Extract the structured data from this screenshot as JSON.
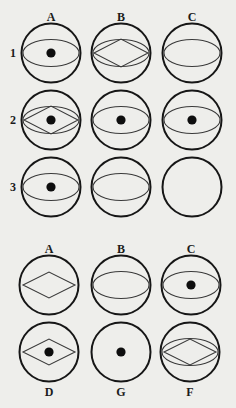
{
  "colors": {
    "background": "#eeeeeb",
    "outer_circle": "#161616",
    "inner_lines": "#3a3a3a",
    "dot": "#0e0e0e"
  },
  "puzzle": {
    "title": "Matrix puzzle",
    "column_labels": [
      {
        "text": "A",
        "x": 51,
        "y": 21
      },
      {
        "text": "B",
        "x": 121,
        "y": 21
      },
      {
        "text": "C",
        "x": 192,
        "y": 21
      }
    ],
    "row_labels": [
      {
        "text": "1",
        "x": 13,
        "y": 57
      },
      {
        "text": "2",
        "x": 13,
        "y": 124
      },
      {
        "text": "3",
        "x": 13,
        "y": 191
      }
    ],
    "cells": [
      {
        "id": "1A",
        "cx": 51,
        "cy": 53,
        "ellipse": true,
        "diamond": false,
        "dot": true
      },
      {
        "id": "1B",
        "cx": 121,
        "cy": 53,
        "ellipse": true,
        "diamond": true,
        "dot": false
      },
      {
        "id": "1C",
        "cx": 192,
        "cy": 53,
        "ellipse": true,
        "diamond": false,
        "dot": false
      },
      {
        "id": "2A",
        "cx": 51,
        "cy": 120,
        "ellipse": true,
        "diamond": true,
        "dot": true
      },
      {
        "id": "2B",
        "cx": 121,
        "cy": 120,
        "ellipse": true,
        "diamond": false,
        "dot": true
      },
      {
        "id": "2C",
        "cx": 192,
        "cy": 120,
        "ellipse": true,
        "diamond": false,
        "dot": true
      },
      {
        "id": "3A",
        "cx": 51,
        "cy": 187,
        "ellipse": true,
        "diamond": false,
        "dot": true
      },
      {
        "id": "3B",
        "cx": 121,
        "cy": 187,
        "ellipse": true,
        "diamond": false,
        "dot": false
      },
      {
        "id": "3C",
        "cx": 192,
        "cy": 187,
        "ellipse": false,
        "diamond": false,
        "dot": false,
        "missing": true
      }
    ]
  },
  "answers": {
    "options": [
      {
        "label": "A",
        "label_x": 49,
        "label_y": 253,
        "cx": 49,
        "cy": 285,
        "ellipse": false,
        "diamond": true,
        "dot": false
      },
      {
        "label": "B",
        "label_x": 121,
        "label_y": 253,
        "cx": 121,
        "cy": 285,
        "ellipse": true,
        "diamond": false,
        "dot": false
      },
      {
        "label": "C",
        "label_x": 191,
        "label_y": 253,
        "cx": 191,
        "cy": 285,
        "ellipse": true,
        "diamond": false,
        "dot": true
      },
      {
        "label": "D",
        "label_x": 49,
        "label_y": 396,
        "cx": 49,
        "cy": 352,
        "ellipse": false,
        "diamond": true,
        "dot": true
      },
      {
        "label": "G",
        "label_x": 121,
        "label_y": 396,
        "cx": 121,
        "cy": 352,
        "ellipse": false,
        "diamond": false,
        "dot": true
      },
      {
        "label": "F",
        "label_x": 190,
        "label_y": 396,
        "cx": 190,
        "cy": 352,
        "ellipse": true,
        "diamond": true,
        "dot": false
      }
    ]
  },
  "geometry": {
    "outer_r": 29.5,
    "ellipse_rx": 28,
    "ellipse_ry": 13.5,
    "diamond_hw": 27,
    "diamond_hh": 14,
    "answer_diamond_hw": 26,
    "answer_diamond_hh": 13,
    "dot_r": 4.6
  }
}
